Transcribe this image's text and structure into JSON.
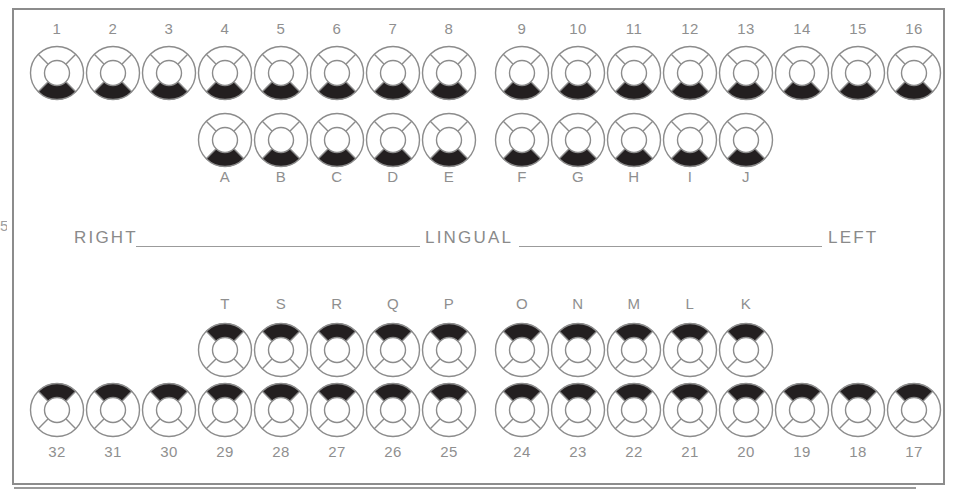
{
  "diagram": {
    "orientation_labels": {
      "right": "RIGHT",
      "center": "LINGUAL",
      "left": "LEFT"
    },
    "edge_mark": "5",
    "colors": {
      "outline": "#8c8c8c",
      "fill": "#231f20",
      "label": "#8f8f8f",
      "background": "#ffffff"
    },
    "surfaces": [
      "center",
      "top",
      "right",
      "bottom",
      "left"
    ],
    "legend": {
      "filled_surface_meaning": "shaded / charted surface"
    },
    "arches": [
      {
        "name": "maxillary",
        "rows": [
          {
            "name": "permanent-upper",
            "label_position": "above",
            "teeth": [
              {
                "id": "1",
                "x": 29,
                "y": 45,
                "label_x": 29,
                "label_y": 20,
                "filled": [
                  "bottom"
                ]
              },
              {
                "id": "2",
                "x": 85,
                "y": 45,
                "label_x": 85,
                "label_y": 20,
                "filled": [
                  "bottom"
                ]
              },
              {
                "id": "3",
                "x": 141,
                "y": 45,
                "label_x": 141,
                "label_y": 20,
                "filled": [
                  "bottom"
                ]
              },
              {
                "id": "4",
                "x": 197,
                "y": 45,
                "label_x": 197,
                "label_y": 20,
                "filled": [
                  "bottom"
                ]
              },
              {
                "id": "5",
                "x": 253,
                "y": 45,
                "label_x": 253,
                "label_y": 20,
                "filled": [
                  "bottom"
                ]
              },
              {
                "id": "6",
                "x": 309,
                "y": 45,
                "label_x": 309,
                "label_y": 20,
                "filled": [
                  "bottom"
                ]
              },
              {
                "id": "7",
                "x": 365,
                "y": 45,
                "label_x": 365,
                "label_y": 20,
                "filled": [
                  "bottom"
                ]
              },
              {
                "id": "8",
                "x": 421,
                "y": 45,
                "label_x": 421,
                "label_y": 20,
                "filled": [
                  "bottom"
                ]
              },
              {
                "id": "9",
                "x": 494,
                "y": 45,
                "label_x": 494,
                "label_y": 20,
                "filled": [
                  "bottom"
                ]
              },
              {
                "id": "10",
                "x": 550,
                "y": 45,
                "label_x": 550,
                "label_y": 20,
                "filled": [
                  "bottom"
                ]
              },
              {
                "id": "11",
                "x": 606,
                "y": 45,
                "label_x": 606,
                "label_y": 20,
                "filled": [
                  "bottom"
                ]
              },
              {
                "id": "12",
                "x": 662,
                "y": 45,
                "label_x": 662,
                "label_y": 20,
                "filled": [
                  "bottom"
                ]
              },
              {
                "id": "13",
                "x": 718,
                "y": 45,
                "label_x": 718,
                "label_y": 20,
                "filled": [
                  "bottom"
                ]
              },
              {
                "id": "14",
                "x": 774,
                "y": 45,
                "label_x": 774,
                "label_y": 20,
                "filled": [
                  "bottom"
                ]
              },
              {
                "id": "15",
                "x": 830,
                "y": 45,
                "label_x": 830,
                "label_y": 20,
                "filled": [
                  "bottom"
                ]
              },
              {
                "id": "16",
                "x": 886,
                "y": 45,
                "label_x": 886,
                "label_y": 20,
                "filled": [
                  "bottom"
                ]
              }
            ]
          },
          {
            "name": "primary-upper",
            "label_position": "below",
            "teeth": [
              {
                "id": "A",
                "x": 197,
                "y": 112,
                "label_x": 197,
                "label_y": 168,
                "filled": [
                  "bottom"
                ]
              },
              {
                "id": "B",
                "x": 253,
                "y": 112,
                "label_x": 253,
                "label_y": 168,
                "filled": [
                  "bottom"
                ]
              },
              {
                "id": "C",
                "x": 309,
                "y": 112,
                "label_x": 309,
                "label_y": 168,
                "filled": [
                  "bottom"
                ]
              },
              {
                "id": "D",
                "x": 365,
                "y": 112,
                "label_x": 365,
                "label_y": 168,
                "filled": [
                  "bottom"
                ]
              },
              {
                "id": "E",
                "x": 421,
                "y": 112,
                "label_x": 421,
                "label_y": 168,
                "filled": [
                  "bottom"
                ]
              },
              {
                "id": "F",
                "x": 494,
                "y": 112,
                "label_x": 494,
                "label_y": 168,
                "filled": [
                  "bottom"
                ]
              },
              {
                "id": "G",
                "x": 550,
                "y": 112,
                "label_x": 550,
                "label_y": 168,
                "filled": [
                  "bottom"
                ]
              },
              {
                "id": "H",
                "x": 606,
                "y": 112,
                "label_x": 606,
                "label_y": 168,
                "filled": [
                  "bottom"
                ]
              },
              {
                "id": "I",
                "x": 662,
                "y": 112,
                "label_x": 662,
                "label_y": 168,
                "filled": [
                  "bottom"
                ]
              },
              {
                "id": "J",
                "x": 718,
                "y": 112,
                "label_x": 718,
                "label_y": 168,
                "filled": [
                  "bottom"
                ]
              }
            ]
          }
        ]
      },
      {
        "name": "mandibular",
        "rows": [
          {
            "name": "primary-lower",
            "label_position": "above",
            "teeth": [
              {
                "id": "T",
                "x": 197,
                "y": 322,
                "label_x": 197,
                "label_y": 295,
                "filled": [
                  "top"
                ]
              },
              {
                "id": "S",
                "x": 253,
                "y": 322,
                "label_x": 253,
                "label_y": 295,
                "filled": [
                  "top"
                ]
              },
              {
                "id": "R",
                "x": 309,
                "y": 322,
                "label_x": 309,
                "label_y": 295,
                "filled": [
                  "top"
                ]
              },
              {
                "id": "Q",
                "x": 365,
                "y": 322,
                "label_x": 365,
                "label_y": 295,
                "filled": [
                  "top"
                ]
              },
              {
                "id": "P",
                "x": 421,
                "y": 322,
                "label_x": 421,
                "label_y": 295,
                "filled": [
                  "top"
                ]
              },
              {
                "id": "O",
                "x": 494,
                "y": 322,
                "label_x": 494,
                "label_y": 295,
                "filled": [
                  "top"
                ]
              },
              {
                "id": "N",
                "x": 550,
                "y": 322,
                "label_x": 550,
                "label_y": 295,
                "filled": [
                  "top"
                ]
              },
              {
                "id": "M",
                "x": 606,
                "y": 322,
                "label_x": 606,
                "label_y": 295,
                "filled": [
                  "top"
                ]
              },
              {
                "id": "L",
                "x": 662,
                "y": 322,
                "label_x": 662,
                "label_y": 295,
                "filled": [
                  "top"
                ]
              },
              {
                "id": "K",
                "x": 718,
                "y": 322,
                "label_x": 718,
                "label_y": 295,
                "filled": [
                  "top"
                ]
              }
            ]
          },
          {
            "name": "permanent-lower",
            "label_position": "below",
            "teeth": [
              {
                "id": "32",
                "x": 29,
                "y": 382,
                "label_x": 29,
                "label_y": 443,
                "filled": [
                  "top"
                ]
              },
              {
                "id": "31",
                "x": 85,
                "y": 382,
                "label_x": 85,
                "label_y": 443,
                "filled": [
                  "top"
                ]
              },
              {
                "id": "30",
                "x": 141,
                "y": 382,
                "label_x": 141,
                "label_y": 443,
                "filled": [
                  "top"
                ]
              },
              {
                "id": "29",
                "x": 197,
                "y": 382,
                "label_x": 197,
                "label_y": 443,
                "filled": [
                  "top"
                ]
              },
              {
                "id": "28",
                "x": 253,
                "y": 382,
                "label_x": 253,
                "label_y": 443,
                "filled": [
                  "top"
                ]
              },
              {
                "id": "27",
                "x": 309,
                "y": 382,
                "label_x": 309,
                "label_y": 443,
                "filled": [
                  "top"
                ]
              },
              {
                "id": "26",
                "x": 365,
                "y": 382,
                "label_x": 365,
                "label_y": 443,
                "filled": [
                  "top"
                ]
              },
              {
                "id": "25",
                "x": 421,
                "y": 382,
                "label_x": 421,
                "label_y": 443,
                "filled": [
                  "top"
                ]
              },
              {
                "id": "24",
                "x": 494,
                "y": 382,
                "label_x": 494,
                "label_y": 443,
                "filled": [
                  "top"
                ]
              },
              {
                "id": "23",
                "x": 550,
                "y": 382,
                "label_x": 550,
                "label_y": 443,
                "filled": [
                  "top"
                ]
              },
              {
                "id": "22",
                "x": 606,
                "y": 382,
                "label_x": 606,
                "label_y": 443,
                "filled": [
                  "top"
                ]
              },
              {
                "id": "21",
                "x": 662,
                "y": 382,
                "label_x": 662,
                "label_y": 443,
                "filled": [
                  "top"
                ]
              },
              {
                "id": "20",
                "x": 718,
                "y": 382,
                "label_x": 718,
                "label_y": 443,
                "filled": [
                  "top"
                ]
              },
              {
                "id": "19",
                "x": 774,
                "y": 382,
                "label_x": 774,
                "label_y": 443,
                "filled": [
                  "top"
                ]
              },
              {
                "id": "18",
                "x": 830,
                "y": 382,
                "label_x": 830,
                "label_y": 443,
                "filled": [
                  "top"
                ]
              },
              {
                "id": "17",
                "x": 886,
                "y": 382,
                "label_x": 886,
                "label_y": 443,
                "filled": [
                  "top"
                ]
              }
            ]
          }
        ]
      }
    ]
  }
}
